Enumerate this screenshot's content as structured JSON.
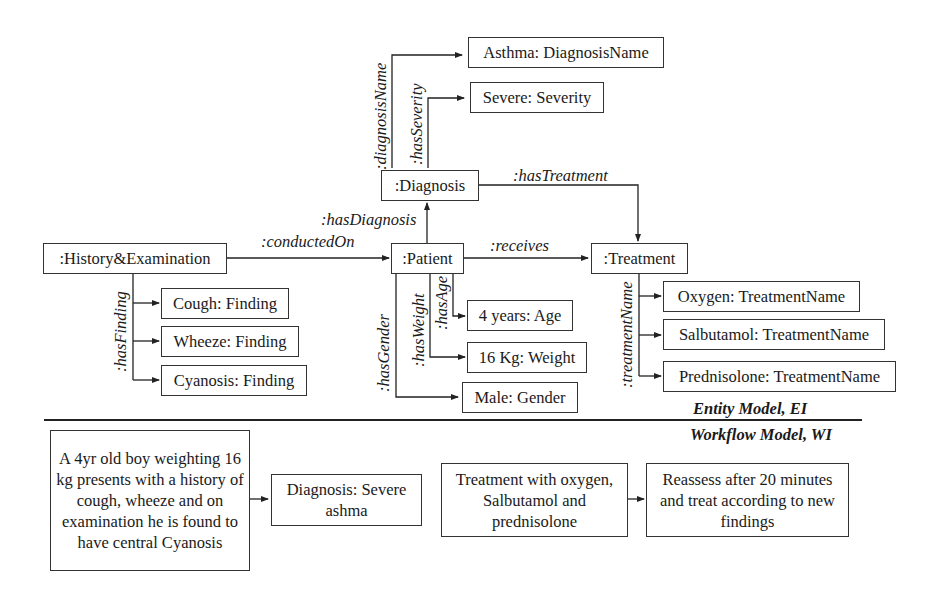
{
  "entity_model": {
    "section_label": "Entity Model, EI",
    "nodes": {
      "history_exam": ":History&Examination",
      "patient": ":Patient",
      "diagnosis": ":Diagnosis",
      "treatment": ":Treatment",
      "diagnosis_name": "Asthma: DiagnosisName",
      "severity": "Severe: Severity",
      "cough": "Cough: Finding",
      "wheeze": "Wheeze: Finding",
      "cyanosis": "Cyanosis: Finding",
      "age": "4 years: Age",
      "weight": "16 Kg: Weight",
      "gender": "Male: Gender",
      "oxygen": "Oxygen: TreatmentName",
      "salbutamol": "Salbutamol: TreatmentName",
      "prednisolone": "Prednisolone: TreatmentName"
    },
    "edges": {
      "conducted_on": ":conductedOn",
      "has_finding": ":hasFinding",
      "has_diagnosis": ":hasDiagnosis",
      "receives": ":receives",
      "has_treatment": ":hasTreatment",
      "diagnosis_name": ":diagnosisName",
      "has_severity": ":hasSeverity",
      "has_gender": ":hasGender",
      "has_weight": ":hasWeight",
      "has_age": ":hasAge",
      "treatment_name": ":treatmentName"
    }
  },
  "workflow_model": {
    "section_label": "Workflow Model, WI",
    "steps": [
      {
        "text": "A 4yr old boy weighting 16 kg presents with a history of cough, wheeze and on examination he is found to have central Cyanosis"
      },
      {
        "text": "Diagnosis: Severe ashma"
      },
      {
        "text": "Treatment with oxygen, Salbutamol and prednisolone"
      },
      {
        "text": "Reassess after 20 minutes and treat according to new findings"
      }
    ]
  }
}
